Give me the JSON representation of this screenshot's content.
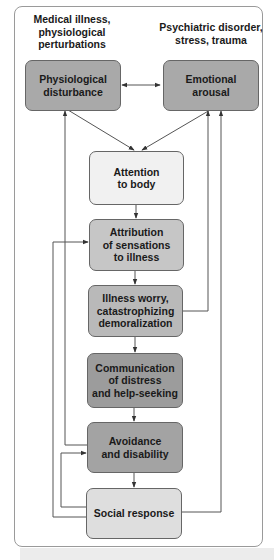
{
  "headers": {
    "left": "Medical illness,\nphysiological\nperturbations",
    "right": "Psychiatric disorder,\nstress, trauma"
  },
  "boxes": {
    "physiological": "Physiological\ndisturbance",
    "emotional": "Emotional\narousal",
    "attention": "Attention\nto body",
    "attribution": "Attribution\nof sensations\nto illness",
    "worry": "Illness worry,\ncatastrophizing\ndemoralization",
    "communication": "Communication\nof distress\nand help-seeking",
    "avoidance": "Avoidance\nand disability",
    "social": "Social response"
  },
  "colors": {
    "physiological": "#a9a9a9",
    "emotional": "#a9a9a9",
    "attention": "#f1f1f1",
    "attribution": "#c6c6c6",
    "worry": "#b9b9b9",
    "communication": "#9c9c9c",
    "avoidance": "#a3a3a3",
    "social": "#dedede",
    "line": "#555555",
    "frame": "#9a9a9a"
  }
}
